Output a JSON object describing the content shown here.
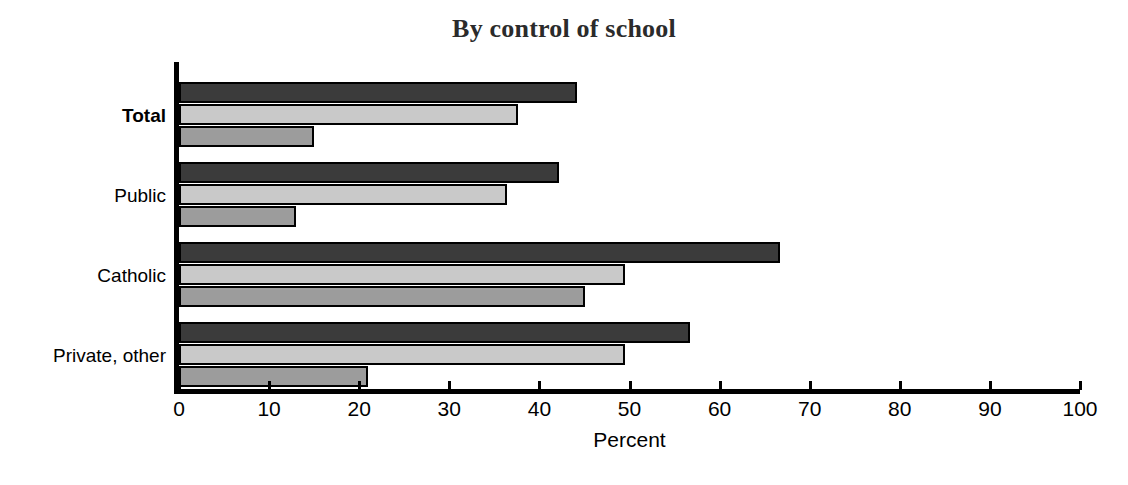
{
  "chart_data": {
    "type": "bar",
    "orientation": "horizontal",
    "title": "By control of school",
    "xlabel": "Percent",
    "ylabel": "",
    "xlim": [
      0,
      100
    ],
    "xticks": [
      0,
      10,
      20,
      30,
      40,
      50,
      60,
      70,
      80,
      90,
      100
    ],
    "xtick_labels": [
      "0",
      "10",
      "20",
      "30",
      "40",
      "50",
      "60",
      "70",
      "80",
      "90",
      "100"
    ],
    "grid": false,
    "legend": "none",
    "categories": [
      "Total",
      "Public",
      "Catholic",
      "Private, other"
    ],
    "emphasized_categories": [
      "Total"
    ],
    "series": [
      {
        "name": "series-1",
        "color": "#3b3b3b",
        "values": [
          44.2,
          42.2,
          66.7,
          56.7
        ]
      },
      {
        "name": "series-2",
        "color": "#c9c9c9",
        "values": [
          37.6,
          36.4,
          49.5,
          49.5
        ]
      },
      {
        "name": "series-3",
        "color": "#9c9c9c",
        "values": [
          15.0,
          13.0,
          45.1,
          21.0
        ]
      }
    ]
  },
  "chart": {
    "title": "By control of school",
    "x_axis_title": "Percent"
  }
}
